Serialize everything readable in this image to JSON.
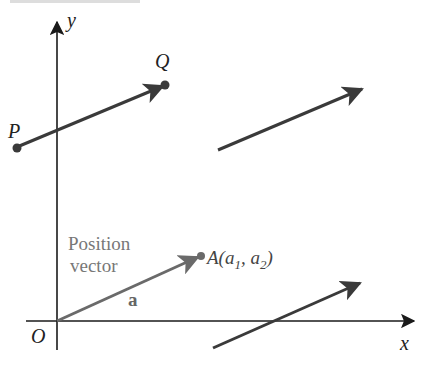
{
  "figure": {
    "caption_fragment": "FIGURE 1.1",
    "axes": {
      "x_label": "x",
      "y_label": "y",
      "origin_label": "O"
    },
    "points": {
      "P": {
        "label": "P"
      },
      "Q": {
        "label": "Q"
      },
      "A": {
        "label": "A(a",
        "sub1": "1",
        "mid": ", a",
        "sub2": "2",
        "close": ")"
      }
    },
    "position_vector": {
      "caption_line1": "Position",
      "caption_line2": "vector",
      "name": "a"
    },
    "colors": {
      "axis": "#1a1a1a",
      "vector": "#3a3a3a",
      "position_vector": "#6a6a6a",
      "caption_text": "#777777",
      "label_text": "#222222"
    }
  }
}
